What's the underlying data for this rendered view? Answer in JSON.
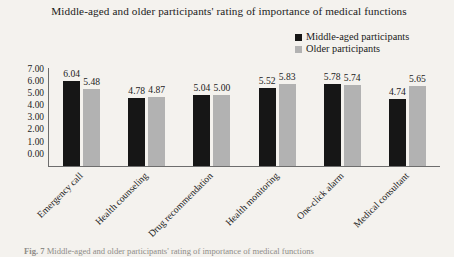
{
  "chart_data": {
    "type": "bar",
    "title": "Middle-aged and older participants' rating of importance of medical functions",
    "xlabel": "",
    "ylabel": "",
    "ylim": [
      0,
      7
    ],
    "ytick_labels": [
      "7.00",
      "6.00",
      "5.00",
      "4.00",
      "3.00",
      "2.00",
      "1.00",
      "0.00"
    ],
    "grid": false,
    "legend_position": "top-right",
    "categories": [
      "Emergency call",
      "Health counseling",
      "Drug recommendation",
      "Health monitoring",
      "One-click alarm",
      "Medical consultant"
    ],
    "series": [
      {
        "name": "Middle-aged participants",
        "color": "#161616",
        "values": [
          6.04,
          4.78,
          5.04,
          5.52,
          5.78,
          4.74
        ],
        "labels": [
          "6.04",
          "4.78",
          "5.04",
          "5.52",
          "5.78",
          "4.74"
        ]
      },
      {
        "name": "Older participants",
        "color": "#b2b2b2",
        "values": [
          5.48,
          4.87,
          5.0,
          5.83,
          5.74,
          5.65
        ],
        "labels": [
          "5.48",
          "4.87",
          "5.00",
          "5.83",
          "5.74",
          "5.65"
        ]
      }
    ]
  },
  "caption": {
    "prefix": "Fig. 7",
    "text": "Middle-aged and older participants' rating of importance of medical functions"
  }
}
